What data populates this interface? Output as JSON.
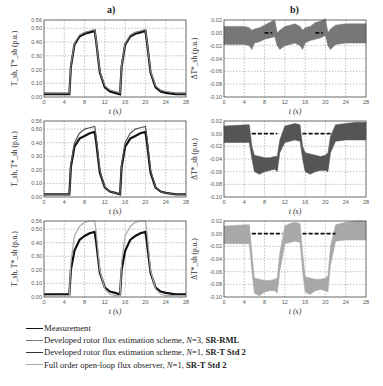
{
  "panels": {
    "a_title": "a)",
    "b_title": "b)"
  },
  "axes": {
    "x_label": "t (s)",
    "a_ylabel": "T_sh, T*_sh (p.u.)",
    "b_ylabel": "ΔT*_sh (p.u.)"
  },
  "legend": {
    "items": [
      {
        "label": "Measurement",
        "color": "#111111",
        "width": 1.6
      },
      {
        "label": "Developed rotor flux estimation scheme, N=3, SR-RML",
        "color": "#7a7a7a",
        "width": 1.0
      },
      {
        "label": "Developed rotor flux estimation scheme, N=1, SR-T Std 2",
        "color": "#333333",
        "width": 1.2
      },
      {
        "label": "Full order open-loop flux observer, N=1, SR-T Std 2",
        "color": "#aaaaaa",
        "width": 1.0
      }
    ],
    "items_rich": [
      {
        "prefix": "Measurement",
        "n": "",
        "suffix": ""
      },
      {
        "prefix": "Developed rotor flux estimation scheme, ",
        "n": "N",
        "eq": "=3, ",
        "bold": "SR-RML"
      },
      {
        "prefix": "Developed rotor flux estimation scheme, ",
        "n": "N",
        "eq": "=1, ",
        "bold": "SR-T Std 2"
      },
      {
        "prefix": "Full order open-loop flux observer, ",
        "n": "N",
        "eq": "=1, ",
        "bold": "SR-T Std 2"
      }
    ]
  },
  "chart_data": [
    {
      "id": "a1",
      "type": "line",
      "panel": "a",
      "row": 1,
      "title": "a)",
      "xlabel": "t (s)",
      "ylabel": "T_sh, T*_sh (p.u.)",
      "xlim": [
        0,
        28
      ],
      "ylim": [
        0,
        0.56
      ],
      "xticks": [
        0,
        4,
        8,
        12,
        16,
        20,
        24,
        28
      ],
      "yticks": [
        0.0,
        0.1,
        0.2,
        0.3,
        0.4,
        0.5,
        0.56
      ],
      "ytick_labels": [
        "0.00",
        "0.10",
        "0.20",
        "0.30",
        "0.40",
        "0.50",
        "0.56"
      ],
      "grid": true,
      "series": [
        {
          "name": "Measurement",
          "color": "#111111",
          "x": [
            0,
            5,
            5.3,
            6,
            7,
            8,
            9,
            10,
            10.3,
            11,
            12,
            13,
            14,
            15,
            15.3,
            16,
            17,
            18,
            19,
            20,
            20.3,
            21,
            22,
            23,
            24,
            26,
            28
          ],
          "y": [
            0.02,
            0.02,
            0.22,
            0.38,
            0.44,
            0.46,
            0.47,
            0.48,
            0.4,
            0.18,
            0.07,
            0.04,
            0.03,
            0.02,
            0.22,
            0.38,
            0.44,
            0.46,
            0.47,
            0.48,
            0.4,
            0.18,
            0.07,
            0.04,
            0.03,
            0.02,
            0.02
          ]
        },
        {
          "name": "Developed rotor flux estimation scheme, N=3, SR-RML",
          "color": "#7a7a7a",
          "x": [
            0,
            5,
            5.3,
            6,
            7,
            8,
            9,
            10,
            10.3,
            11,
            12,
            13,
            14,
            15,
            15.3,
            16,
            17,
            18,
            19,
            20,
            20.3,
            21,
            22,
            23,
            24,
            26,
            28
          ],
          "y": [
            0.03,
            0.03,
            0.23,
            0.39,
            0.45,
            0.47,
            0.48,
            0.49,
            0.41,
            0.19,
            0.08,
            0.05,
            0.04,
            0.03,
            0.23,
            0.39,
            0.45,
            0.47,
            0.48,
            0.49,
            0.41,
            0.19,
            0.08,
            0.05,
            0.04,
            0.03,
            0.03
          ]
        }
      ]
    },
    {
      "id": "b1",
      "type": "line",
      "panel": "b",
      "row": 1,
      "title": "b)",
      "xlabel": "t (s)",
      "ylabel": "ΔT*_sh (p.u.)",
      "xlim": [
        0,
        28
      ],
      "ylim": [
        -0.1,
        0.02
      ],
      "xticks": [
        0,
        4,
        8,
        12,
        16,
        20,
        24,
        28
      ],
      "yticks": [
        -0.1,
        -0.08,
        -0.06,
        -0.04,
        -0.02,
        0.0,
        0.02
      ],
      "ytick_labels": [
        "-0.10",
        "-0.08",
        "-0.06",
        "-0.04",
        "-0.02",
        "0.00",
        "0.02"
      ],
      "grid": true,
      "series": [
        {
          "name": "Error band",
          "color": "#777777",
          "band": true,
          "x": [
            0,
            4,
            5,
            5.5,
            6,
            7,
            8,
            9,
            10,
            10.5,
            11,
            12,
            13,
            14,
            15,
            15.5,
            16,
            17,
            18,
            19,
            20,
            20.5,
            21,
            22,
            24,
            26,
            28
          ],
          "upper": [
            0.01,
            0.01,
            0.008,
            0.004,
            0.006,
            0.008,
            0.012,
            0.016,
            0.02,
            0.0,
            0.004,
            0.01,
            0.012,
            0.014,
            0.01,
            0.004,
            0.008,
            0.01,
            0.016,
            0.018,
            0.022,
            0.0,
            0.006,
            0.012,
            0.014,
            0.014,
            0.014
          ],
          "lower": [
            -0.018,
            -0.018,
            -0.02,
            -0.026,
            -0.016,
            -0.014,
            -0.01,
            -0.008,
            -0.006,
            -0.02,
            -0.026,
            -0.02,
            -0.018,
            -0.016,
            -0.02,
            -0.026,
            -0.016,
            -0.012,
            -0.01,
            -0.008,
            -0.004,
            -0.02,
            -0.026,
            -0.018,
            -0.016,
            -0.016,
            -0.016
          ]
        },
        {
          "name": "Reference (dashed)",
          "color": "#111111",
          "dashed": true,
          "segments": [
            [
              8,
              9.5,
              0.0
            ],
            [
              18,
              19.5,
              0.0
            ]
          ]
        }
      ]
    },
    {
      "id": "a2",
      "type": "line",
      "panel": "a",
      "row": 2,
      "xlabel": "t (s)",
      "ylabel": "T_sh, T*_sh (p.u.)",
      "xlim": [
        0,
        28
      ],
      "ylim": [
        0,
        0.56
      ],
      "xticks": [
        0,
        4,
        8,
        12,
        16,
        20,
        24,
        28
      ],
      "yticks": [
        0.0,
        0.1,
        0.2,
        0.3,
        0.4,
        0.5,
        0.56
      ],
      "ytick_labels": [
        "0.00",
        "0.10",
        "0.20",
        "0.30",
        "0.40",
        "0.50",
        "0.56"
      ],
      "grid": true,
      "series": [
        {
          "name": "Measurement",
          "color": "#111111",
          "x": [
            0,
            5,
            5.3,
            6,
            7,
            8,
            9,
            10,
            10.3,
            11,
            12,
            13,
            14,
            15,
            15.3,
            16,
            17,
            18,
            19,
            20,
            20.3,
            21,
            22,
            23,
            24,
            26,
            28
          ],
          "y": [
            0.02,
            0.02,
            0.22,
            0.37,
            0.43,
            0.45,
            0.47,
            0.48,
            0.4,
            0.18,
            0.07,
            0.04,
            0.03,
            0.02,
            0.22,
            0.37,
            0.43,
            0.45,
            0.47,
            0.48,
            0.4,
            0.18,
            0.07,
            0.04,
            0.03,
            0.02,
            0.02
          ]
        },
        {
          "name": "Developed rotor flux estimation scheme, N=1, SR-T Std 2",
          "color": "#555555",
          "x": [
            0,
            5,
            5.3,
            6,
            7,
            8,
            9,
            10,
            10.3,
            11,
            12,
            13,
            14,
            15,
            15.3,
            16,
            17,
            18,
            19,
            20,
            20.3,
            21,
            22,
            23,
            24,
            26,
            28
          ],
          "y": [
            0.02,
            0.02,
            0.24,
            0.4,
            0.47,
            0.5,
            0.51,
            0.52,
            0.44,
            0.2,
            0.07,
            0.04,
            0.03,
            0.02,
            0.24,
            0.4,
            0.47,
            0.5,
            0.51,
            0.52,
            0.44,
            0.2,
            0.07,
            0.04,
            0.03,
            0.02,
            0.02
          ]
        }
      ]
    },
    {
      "id": "b2",
      "type": "line",
      "panel": "b",
      "row": 2,
      "xlabel": "t (s)",
      "ylabel": "ΔT*_sh (p.u.)",
      "xlim": [
        0,
        28
      ],
      "ylim": [
        -0.1,
        0.02
      ],
      "xticks": [
        0,
        4,
        8,
        12,
        16,
        20,
        24,
        28
      ],
      "yticks": [
        -0.1,
        -0.08,
        -0.06,
        -0.04,
        -0.02,
        0.0,
        0.02
      ],
      "ytick_labels": [
        "-0.10",
        "-0.08",
        "-0.06",
        "-0.04",
        "-0.02",
        "0.00",
        "0.02"
      ],
      "grid": true,
      "series": [
        {
          "name": "Error band",
          "color": "#555555",
          "band": true,
          "x": [
            0,
            4.5,
            5,
            5.5,
            6,
            7,
            8,
            9,
            10,
            10.5,
            11,
            12,
            13,
            14,
            15,
            15.5,
            16,
            17,
            18,
            19,
            20,
            20.5,
            21,
            22,
            24,
            26,
            28
          ],
          "upper": [
            0.012,
            0.014,
            0.014,
            -0.02,
            -0.034,
            -0.036,
            -0.038,
            -0.038,
            -0.036,
            -0.036,
            -0.01,
            0.012,
            0.014,
            0.016,
            0.014,
            -0.02,
            -0.03,
            -0.032,
            -0.034,
            -0.036,
            -0.034,
            -0.03,
            -0.004,
            0.014,
            0.016,
            0.018,
            0.018
          ],
          "lower": [
            -0.014,
            -0.014,
            -0.014,
            -0.04,
            -0.06,
            -0.064,
            -0.06,
            -0.058,
            -0.056,
            -0.06,
            -0.03,
            -0.014,
            -0.012,
            -0.01,
            -0.012,
            -0.04,
            -0.06,
            -0.064,
            -0.06,
            -0.058,
            -0.058,
            -0.06,
            -0.03,
            -0.012,
            -0.01,
            -0.01,
            -0.01
          ]
        },
        {
          "name": "Reference (dashed)",
          "color": "#111111",
          "dashed": true,
          "segments": [
            [
              5.5,
              10.5,
              0.0
            ],
            [
              15.5,
              21.0,
              0.0
            ]
          ]
        }
      ]
    },
    {
      "id": "a3",
      "type": "line",
      "panel": "a",
      "row": 3,
      "xlabel": "t (s)",
      "ylabel": "T_sh, T*_sh (p.u.)",
      "xlim": [
        0,
        28
      ],
      "ylim": [
        0,
        0.56
      ],
      "xticks": [
        0,
        4,
        8,
        12,
        16,
        20,
        24,
        28
      ],
      "yticks": [
        0.0,
        0.1,
        0.2,
        0.3,
        0.4,
        0.5,
        0.56
      ],
      "ytick_labels": [
        "0.00",
        "0.10",
        "0.20",
        "0.30",
        "0.40",
        "0.50",
        "0.56"
      ],
      "grid": true,
      "series": [
        {
          "name": "Measurement",
          "color": "#111111",
          "x": [
            0,
            5,
            5.3,
            6,
            7,
            8,
            9,
            10,
            10.3,
            11,
            12,
            13,
            14,
            15,
            15.3,
            16,
            17,
            18,
            19,
            20,
            20.3,
            21,
            22,
            23,
            24,
            26,
            28
          ],
          "y": [
            0.02,
            0.02,
            0.2,
            0.34,
            0.42,
            0.45,
            0.47,
            0.48,
            0.4,
            0.18,
            0.07,
            0.04,
            0.03,
            0.02,
            0.2,
            0.34,
            0.42,
            0.45,
            0.47,
            0.48,
            0.4,
            0.18,
            0.07,
            0.04,
            0.03,
            0.02,
            0.02
          ]
        },
        {
          "name": "Full order open-loop flux observer, N=1, SR-T Std 2",
          "color": "#aaaaaa",
          "x": [
            0,
            5,
            5.3,
            6,
            7,
            8,
            9,
            10,
            10.3,
            11,
            12,
            13,
            14,
            15,
            15.3,
            16,
            17,
            18,
            19,
            20,
            20.3,
            21,
            22,
            23,
            24,
            26,
            28
          ],
          "y": [
            0.01,
            0.01,
            0.26,
            0.45,
            0.52,
            0.55,
            0.56,
            0.56,
            0.48,
            0.2,
            0.06,
            0.02,
            0.01,
            0.01,
            0.26,
            0.45,
            0.52,
            0.55,
            0.56,
            0.56,
            0.48,
            0.2,
            0.06,
            0.02,
            0.01,
            0.01,
            0.01
          ]
        }
      ]
    },
    {
      "id": "b3",
      "type": "line",
      "panel": "b",
      "row": 3,
      "xlabel": "t (s)",
      "ylabel": "ΔT*_sh (p.u.)",
      "xlim": [
        0,
        28
      ],
      "ylim": [
        -0.1,
        0.02
      ],
      "xticks": [
        0,
        4,
        8,
        12,
        16,
        20,
        24,
        28
      ],
      "yticks": [
        -0.1,
        -0.08,
        -0.06,
        -0.04,
        -0.02,
        0.0,
        0.02
      ],
      "ytick_labels": [
        "-0.10",
        "-0.08",
        "-0.06",
        "-0.04",
        "-0.02",
        "0.00",
        "0.02"
      ],
      "grid": true,
      "series": [
        {
          "name": "Error band",
          "color": "#a8a8a8",
          "band": true,
          "x": [
            0,
            4.5,
            5,
            5.5,
            6,
            7,
            8,
            9,
            10,
            10.5,
            11,
            12,
            13,
            14,
            15,
            15.5,
            16,
            17,
            18,
            19,
            20,
            20.5,
            21,
            22,
            24,
            26,
            28
          ],
          "upper": [
            0.012,
            0.014,
            0.014,
            -0.03,
            -0.07,
            -0.072,
            -0.074,
            -0.074,
            -0.072,
            -0.07,
            -0.03,
            0.012,
            0.016,
            0.018,
            0.016,
            -0.03,
            -0.068,
            -0.07,
            -0.072,
            -0.072,
            -0.07,
            -0.066,
            -0.02,
            0.014,
            0.018,
            0.02,
            0.02
          ],
          "lower": [
            -0.016,
            -0.016,
            -0.016,
            -0.06,
            -0.094,
            -0.098,
            -0.092,
            -0.09,
            -0.09,
            -0.094,
            -0.06,
            -0.016,
            -0.014,
            -0.012,
            -0.014,
            -0.06,
            -0.092,
            -0.096,
            -0.09,
            -0.088,
            -0.09,
            -0.092,
            -0.05,
            -0.012,
            -0.01,
            -0.01,
            -0.01
          ]
        },
        {
          "name": "Reference (dashed)",
          "color": "#111111",
          "dashed": true,
          "segments": [
            [
              5.5,
              11.5,
              0.0
            ],
            [
              15.5,
              22.0,
              0.0
            ]
          ]
        }
      ]
    }
  ]
}
